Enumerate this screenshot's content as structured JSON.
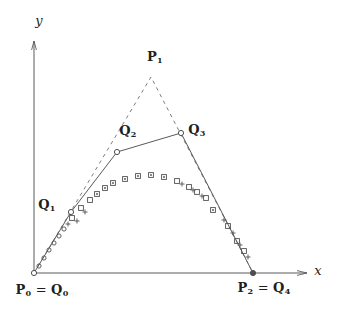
{
  "figure": {
    "width": 339,
    "height": 313,
    "colors": {
      "background": "#ffffff",
      "line": "#5a5a5a",
      "dashed_line": "#6e6e6e",
      "marker": "#4f4f4f",
      "text": "#1f1f1f"
    },
    "axes": {
      "x_label": "x",
      "y_label": "y",
      "origin": [
        34,
        273
      ],
      "x_end": [
        307,
        273
      ],
      "y_end": [
        34,
        41
      ]
    },
    "dashed_polygon": {
      "name": "control-polygon-p",
      "points": [
        [
          34,
          273
        ],
        [
          151,
          77
        ],
        [
          253,
          273
        ]
      ]
    },
    "solid_polygon": {
      "name": "control-polygon-q",
      "points": [
        [
          34,
          273
        ],
        [
          71,
          212
        ],
        [
          117,
          152
        ],
        [
          181,
          133
        ],
        [
          253,
          273
        ]
      ]
    },
    "vertices": [
      {
        "x": 34,
        "y": 273,
        "filled": false
      },
      {
        "x": 71,
        "y": 212,
        "filled": false
      },
      {
        "x": 117,
        "y": 152,
        "filled": false
      },
      {
        "x": 181,
        "y": 133,
        "filled": false
      },
      {
        "x": 253,
        "y": 273,
        "filled": true
      }
    ],
    "curve_markers": [
      [
        39,
        266,
        "o"
      ],
      [
        44,
        258,
        "o"
      ],
      [
        49,
        250,
        "o"
      ],
      [
        54,
        243,
        "o"
      ],
      [
        59,
        236,
        "o"
      ],
      [
        64,
        229,
        "o"
      ],
      [
        68,
        224,
        "p"
      ],
      [
        72,
        218,
        "s"
      ],
      [
        77,
        221,
        "p"
      ],
      [
        81,
        208,
        "s"
      ],
      [
        85,
        212,
        "p"
      ],
      [
        90,
        200,
        "s"
      ],
      [
        97,
        194,
        "d"
      ],
      [
        105,
        188,
        "d"
      ],
      [
        113,
        183,
        "d"
      ],
      [
        125,
        179,
        "d"
      ],
      [
        138,
        176,
        "d"
      ],
      [
        151,
        175,
        "d"
      ],
      [
        164,
        177,
        "d"
      ],
      [
        177,
        181,
        "s"
      ],
      [
        182,
        184,
        "p"
      ],
      [
        189,
        187,
        "s"
      ],
      [
        193,
        190,
        "p"
      ],
      [
        197,
        192,
        "s"
      ],
      [
        202,
        196,
        "p"
      ],
      [
        206,
        198,
        "s"
      ],
      [
        213,
        210,
        "d"
      ],
      [
        224,
        220,
        "p"
      ],
      [
        228,
        226,
        "s"
      ],
      [
        233,
        233,
        "p"
      ],
      [
        237,
        241,
        "s"
      ],
      [
        240,
        245,
        "p"
      ],
      [
        244,
        251,
        "s"
      ],
      [
        248,
        257,
        "p"
      ]
    ],
    "labels": [
      {
        "name": "y-axis-label",
        "x": 39,
        "y": 20,
        "parts": [
          {
            "t": "y",
            "it": true
          }
        ]
      },
      {
        "name": "x-axis-label",
        "x": 318,
        "y": 270,
        "parts": [
          {
            "t": "x",
            "it": true
          }
        ]
      },
      {
        "name": "label-p1",
        "x": 155,
        "y": 57,
        "parts": [
          {
            "t": "P",
            "b": true
          },
          {
            "t": "1",
            "b": true,
            "sub": true
          }
        ]
      },
      {
        "name": "label-q1",
        "x": 47,
        "y": 205,
        "parts": [
          {
            "t": "Q",
            "b": true
          },
          {
            "t": "1",
            "b": true,
            "sub": true
          }
        ]
      },
      {
        "name": "label-q2",
        "x": 128,
        "y": 131,
        "parts": [
          {
            "t": "Q",
            "b": true
          },
          {
            "t": "2",
            "b": true,
            "sub": true
          }
        ]
      },
      {
        "name": "label-q3",
        "x": 197,
        "y": 130,
        "parts": [
          {
            "t": "Q",
            "b": true
          },
          {
            "t": "3",
            "b": true,
            "sub": true
          }
        ]
      },
      {
        "name": "label-p0-q0",
        "x": 42,
        "y": 290,
        "parts": [
          {
            "t": "P",
            "b": true
          },
          {
            "t": "0",
            "b": true,
            "sub": true
          },
          {
            "t": " = "
          },
          {
            "t": "Q",
            "b": true
          },
          {
            "t": "0",
            "b": true,
            "sub": true
          }
        ]
      },
      {
        "name": "label-p2-q4",
        "x": 264,
        "y": 288,
        "parts": [
          {
            "t": "P",
            "b": true
          },
          {
            "t": "2",
            "b": true,
            "sub": true
          },
          {
            "t": " = "
          },
          {
            "t": "Q",
            "b": true
          },
          {
            "t": "4",
            "b": true,
            "sub": true
          }
        ]
      }
    ]
  }
}
